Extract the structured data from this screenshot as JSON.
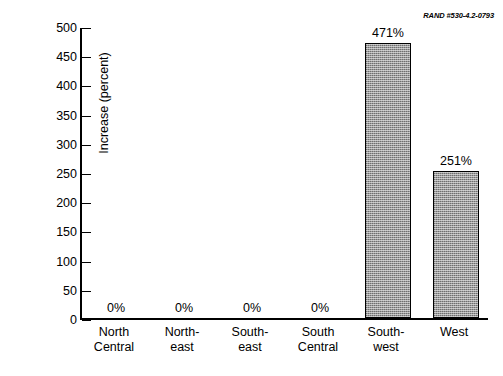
{
  "credit": "RAND #530-4.2-0793",
  "chart_data": {
    "type": "bar",
    "title": "",
    "xlabel": "",
    "ylabel": "Increase (percent)",
    "ylim": [
      0,
      500
    ],
    "ytick_step": 50,
    "yticks": [
      0,
      50,
      100,
      150,
      200,
      250,
      300,
      350,
      400,
      450,
      500
    ],
    "grid": false,
    "legend": null,
    "categories": [
      "North\nCentral",
      "North-\neast",
      "South-\neast",
      "South\nCentral",
      "South-\nwest",
      "West"
    ],
    "category_lines": [
      [
        "North",
        "Central"
      ],
      [
        "North-",
        "east"
      ],
      [
        "South-",
        "east"
      ],
      [
        "South",
        "Central"
      ],
      [
        "South-",
        "west"
      ],
      [
        "West",
        ""
      ]
    ],
    "values": [
      0,
      0,
      0,
      0,
      471,
      251
    ],
    "value_labels": [
      "0%",
      "0%",
      "0%",
      "0%",
      "471%",
      "251%"
    ],
    "bar_color": "#9a9a9a",
    "bar_edge_color": "#000000"
  }
}
